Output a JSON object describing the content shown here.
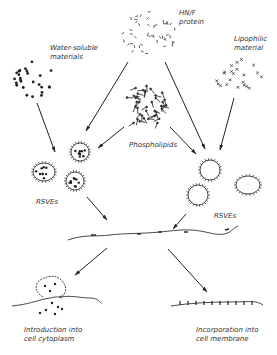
{
  "diagram": {
    "labels": {
      "hn_f_protein": [
        "HN/F",
        "protein"
      ],
      "water_soluble": [
        "Water-soluble",
        "materials"
      ],
      "lipophilic": [
        "Lipophilic",
        "material"
      ],
      "phospholipids": "Phospholipids",
      "rsves_left": "RSVEs",
      "rsves_right": "RSVEs",
      "introduction": [
        "Introduction into",
        "cell cytoplasm"
      ],
      "incorporation": [
        "Incorporation into",
        "cell membrane"
      ]
    },
    "nodes": [
      {
        "id": "water-soluble-materials",
        "shape": "dots"
      },
      {
        "id": "hn-f-protein",
        "shape": "dashes"
      },
      {
        "id": "lipophilic-material",
        "shape": "crosses"
      },
      {
        "id": "phospholipids",
        "shape": "rods"
      },
      {
        "id": "rsves-loaded",
        "shape": "spiky-circles-with-dots"
      },
      {
        "id": "rsves-empty",
        "shape": "spiky-rings"
      },
      {
        "id": "cell-membrane",
        "shape": "wavy-line"
      },
      {
        "id": "introduction-into-cytoplasm",
        "shape": "fused-vesicle"
      },
      {
        "id": "incorporation-into-membrane",
        "shape": "membrane-with-proteins"
      }
    ],
    "edges": [
      {
        "from": "water-soluble-materials",
        "to": "rsves-loaded"
      },
      {
        "from": "hn-f-protein",
        "to": "rsves-loaded"
      },
      {
        "from": "hn-f-protein",
        "to": "rsves-empty"
      },
      {
        "from": "phospholipids",
        "to": "rsves-loaded"
      },
      {
        "from": "phospholipids",
        "to": "rsves-empty"
      },
      {
        "from": "lipophilic-material",
        "to": "rsves-empty"
      },
      {
        "from": "rsves-loaded",
        "to": "cell-membrane"
      },
      {
        "from": "rsves-empty",
        "to": "cell-membrane"
      },
      {
        "from": "cell-membrane",
        "to": "introduction-into-cytoplasm"
      },
      {
        "from": "cell-membrane",
        "to": "incorporation-into-membrane"
      }
    ]
  }
}
